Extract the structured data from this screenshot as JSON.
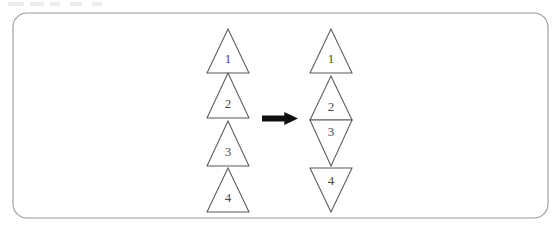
{
  "figure": {
    "background_color": "#ffffff",
    "panel": {
      "name": "rounded-rectangle-panel",
      "x": 13,
      "y": 13,
      "width": 535,
      "height": 205,
      "corner_radius": 14,
      "stroke_color": "#9a9a9a",
      "fill_color": "#ffffff"
    },
    "label_color": "#4a4a4a",
    "shape_stroke_color": "#5a5a5a",
    "shape_fill_color": "#ffffff",
    "arrow": {
      "name": "transformation-arrow",
      "label": "",
      "direction": "right",
      "color": "#111111",
      "x": 262,
      "y": 112,
      "width": 36,
      "height": 13
    },
    "left_group": {
      "name": "left-triangle-stack",
      "center_x": 228,
      "triangles": [
        {
          "label": "1",
          "orientation": "up",
          "apex_y": 29,
          "base_y": 73,
          "half_width": 21,
          "label_y": 60
        },
        {
          "label": "2",
          "orientation": "up",
          "apex_y": 73,
          "base_y": 118,
          "half_width": 21,
          "label_y": 105
        },
        {
          "label": "3",
          "orientation": "up",
          "apex_y": 121,
          "base_y": 166,
          "half_width": 21,
          "label_y": 153
        },
        {
          "label": "4",
          "orientation": "up",
          "apex_y": 168,
          "base_y": 212,
          "half_width": 21,
          "label_y": 199
        }
      ]
    },
    "right_group": {
      "name": "right-triangle-stack",
      "center_x": 331,
      "triangles": [
        {
          "label": "1",
          "orientation": "up",
          "apex_y": 29,
          "base_y": 73,
          "half_width": 21,
          "label_y": 60
        },
        {
          "label": "2",
          "orientation": "up",
          "apex_y": 76,
          "base_y": 120,
          "half_width": 21,
          "label_y": 108
        },
        {
          "label": "3",
          "orientation": "down",
          "apex_y": 166,
          "base_y": 120,
          "half_width": 21,
          "label_y": 133
        },
        {
          "label": "4",
          "orientation": "down",
          "apex_y": 212,
          "base_y": 168,
          "half_width": 21,
          "label_y": 182
        }
      ]
    }
  }
}
